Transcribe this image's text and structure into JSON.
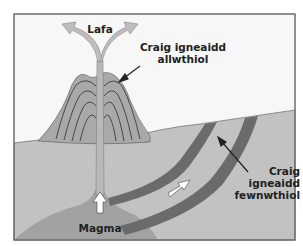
{
  "diagram": {
    "labels": {
      "lava": "Lafa",
      "extrusive_line1": "Craig igneaidd",
      "extrusive_line2": "allwthiol",
      "intrusive_line1": "Craig",
      "intrusive_line2": "igneaidd",
      "intrusive_line3": "fewnwthiol",
      "magma": "Magma"
    },
    "colors": {
      "sky": "#f7f7f7",
      "frame": "#6e6e6e",
      "ground": "#c2c2c2",
      "volcano": "#a9a9a9",
      "volcano_layers": "#3d3d3d",
      "conduit": "#b8b8b8",
      "magma_chamber": "#a2a2a2",
      "intrusion": "#6b6b6b",
      "lava_arrows": "#bdbdbd",
      "arrow_fill": "#ffffff",
      "pointer": "#222222",
      "text": "#222222"
    }
  }
}
